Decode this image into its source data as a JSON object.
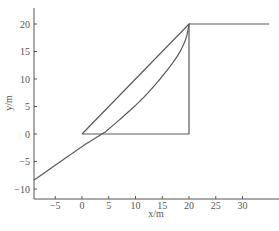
{
  "chart_data": {
    "type": "line",
    "title": "",
    "xlabel": "x/m",
    "ylabel": "y/m",
    "xlim": [
      -9,
      36
    ],
    "ylim": [
      -12,
      23
    ],
    "x_ticks": [
      -5,
      0,
      5,
      10,
      15,
      20,
      25,
      30
    ],
    "y_ticks": [
      -10,
      -5,
      0,
      5,
      10,
      15,
      20
    ],
    "grid": false,
    "legend": null,
    "series": [
      {
        "name": "curved-profile",
        "x": [
          -9,
          -5,
          0,
          3.7,
          5,
          10,
          13,
          15,
          17,
          18.5,
          19.5,
          20
        ],
        "y": [
          -8.4,
          -5.7,
          -2.3,
          0,
          0.9,
          5.2,
          8.2,
          10.5,
          13,
          15.3,
          17.6,
          20
        ]
      },
      {
        "name": "triangle",
        "x": [
          0,
          20,
          20,
          0
        ],
        "y": [
          0,
          20,
          0,
          0
        ]
      },
      {
        "name": "upper-horizontal",
        "x": [
          20,
          35
        ],
        "y": [
          20,
          20
        ]
      }
    ]
  },
  "axes": {
    "xlabel": "x/m",
    "ylabel": "y/m",
    "x_tick_labels": [
      "-5",
      "0",
      "5",
      "10",
      "15",
      "20",
      "25",
      "30"
    ],
    "y_tick_labels": [
      "-10",
      "-5",
      "0",
      "5",
      "10",
      "15",
      "20"
    ]
  }
}
